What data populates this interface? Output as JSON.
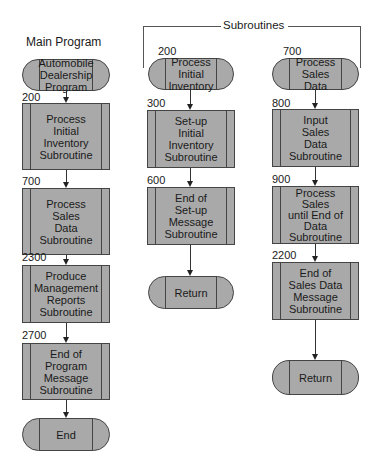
{
  "main": {
    "title": "Main Program",
    "start": "Automobile\nDealership\nProgram",
    "steps": [
      {
        "num": "200",
        "label": "Process\nInitial\nInventory\nSubroutine"
      },
      {
        "num": "700",
        "label": "Process\nSales\nData\nSubroutine"
      },
      {
        "num": "2300",
        "label": "Produce\nManagement\nReports\nSubroutine"
      },
      {
        "num": "2700",
        "label": "End of\nProgram\nMessage\nSubroutine"
      }
    ],
    "end": "End"
  },
  "subroutines": {
    "title": "Subroutines",
    "col1": {
      "num": "200",
      "start": "Process\nInitial\nInventory",
      "steps": [
        {
          "num": "300",
          "label": "Set-up\nInitial\nInventory\nSubroutine"
        },
        {
          "num": "600",
          "label": "End of\nSet-up\nMessage\nSubroutine"
        }
      ],
      "end": "Return"
    },
    "col2": {
      "num": "700",
      "start": "Process\nSales\nData",
      "steps": [
        {
          "num": "800",
          "label": "Input\nSales\nData\nSubroutine"
        },
        {
          "num": "900",
          "label": "Process\nSales\nuntil End of\nData\nSubroutine"
        },
        {
          "num": "2200",
          "label": "End of\nSales Data\nMessage\nSubroutine"
        }
      ],
      "end": "Return"
    }
  }
}
